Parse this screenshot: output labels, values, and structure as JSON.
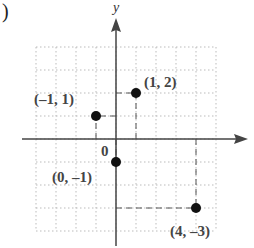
{
  "chart_data": {
    "type": "scatter",
    "title": "",
    "part_marker": ")",
    "xlabel": "x",
    "ylabel": "y",
    "origin_label": "0",
    "xlim": [
      -4,
      5
    ],
    "ylim": [
      -4,
      4
    ],
    "grid": true,
    "points": [
      {
        "x": -1,
        "y": 1,
        "label": "(–1, 1)"
      },
      {
        "x": 1,
        "y": 2,
        "label": "(1, 2)"
      },
      {
        "x": 0,
        "y": -1,
        "label": "(0, –1)"
      },
      {
        "x": 4,
        "y": -3,
        "label": "(4, –3)"
      }
    ]
  }
}
